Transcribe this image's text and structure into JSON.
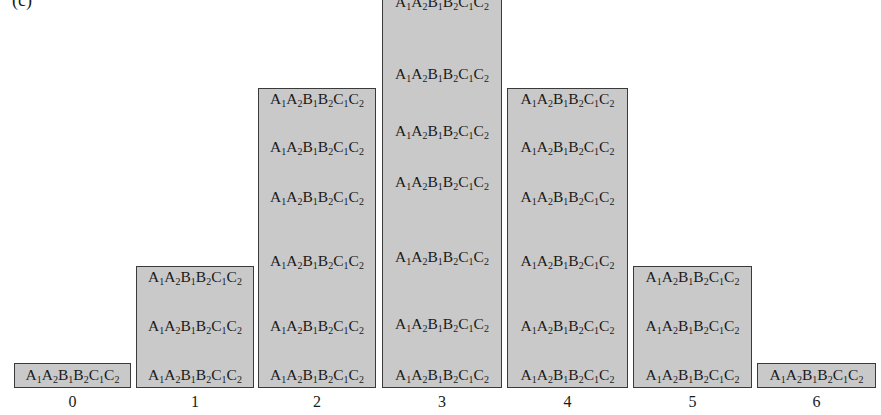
{
  "figure": {
    "panel_label": "(c)",
    "genotype_label": "A1A2B1B2C1C2"
  },
  "chart_data": {
    "type": "bar",
    "title": "",
    "panel": "(c)",
    "xlabel": "",
    "ylabel": "",
    "categories": [
      "0",
      "1",
      "2",
      "3",
      "4",
      "5",
      "6"
    ],
    "values": [
      1,
      3,
      6,
      7,
      6,
      3,
      1
    ],
    "bar_text": "A1A2B1B2C1C2",
    "fill_color": "#c9c9c9",
    "edge_color": "#3a3a3a",
    "grid": false,
    "legend": null
  },
  "bars": [
    {
      "x": 14,
      "w": 117,
      "top": 363,
      "label": "0",
      "items": [
        376
      ]
    },
    {
      "x": 136,
      "w": 118,
      "top": 266,
      "label": "1",
      "items": [
        278,
        327,
        376
      ]
    },
    {
      "x": 258,
      "w": 118,
      "top": 88,
      "label": "2",
      "items": [
        100,
        148,
        198,
        262,
        327,
        376
      ]
    },
    {
      "x": 382,
      "w": 120,
      "top": -5,
      "label": "3",
      "items": [
        3,
        75,
        132,
        183,
        258,
        325,
        376
      ]
    },
    {
      "x": 507,
      "w": 121,
      "top": 88,
      "label": "4",
      "items": [
        100,
        148,
        198,
        262,
        327,
        376
      ]
    },
    {
      "x": 633,
      "w": 119,
      "top": 266,
      "label": "5",
      "items": [
        278,
        327,
        376
      ]
    },
    {
      "x": 757,
      "w": 119,
      "top": 363,
      "label": "6",
      "items": [
        376
      ]
    }
  ]
}
